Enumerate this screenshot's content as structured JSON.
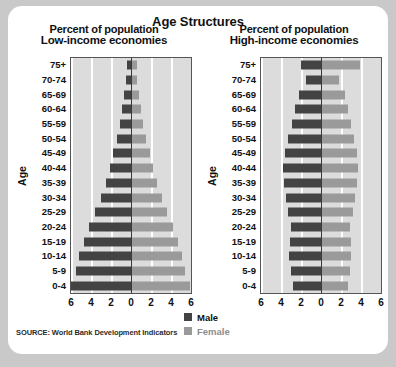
{
  "chart_data": {
    "type": "bar",
    "title": "Age Structures",
    "xlabel": "Percent of population",
    "ylabel": "Age",
    "grid": true,
    "legend_position": "bottom-center",
    "xlim": [
      -6,
      6
    ],
    "xticks": [
      "6",
      "4",
      "2",
      "0",
      "2",
      "4",
      "6"
    ],
    "xtick_values": [
      -6,
      -4,
      -2,
      0,
      2,
      4,
      6
    ],
    "categories": [
      "0-4",
      "5-9",
      "10-14",
      "15-19",
      "20-24",
      "25-29",
      "30-34",
      "35-39",
      "40-44",
      "45-49",
      "50-54",
      "55-59",
      "60-64",
      "65-69",
      "70-74",
      "75+"
    ],
    "legend": [
      {
        "name": "Male",
        "color": "#434343"
      },
      {
        "name": "Female",
        "color": "#9a9a9a"
      }
    ],
    "panels": [
      {
        "title": "Low-income economies",
        "series": [
          {
            "name": "Male",
            "side": "left",
            "values": [
              6.0,
              5.5,
              5.2,
              4.7,
              4.2,
              3.6,
              3.0,
              2.5,
              2.1,
              1.8,
              1.4,
              1.1,
              0.9,
              0.7,
              0.5,
              0.4
            ]
          },
          {
            "name": "Female",
            "side": "right",
            "values": [
              5.9,
              5.4,
              5.1,
              4.7,
              4.2,
              3.6,
              3.1,
              2.6,
              2.2,
              1.9,
              1.5,
              1.2,
              1.0,
              0.8,
              0.6,
              0.6
            ]
          }
        ]
      },
      {
        "title": "High-income economies",
        "series": [
          {
            "name": "Male",
            "side": "left",
            "values": [
              2.8,
              3.0,
              3.2,
              3.1,
              3.0,
              3.3,
              3.5,
              3.7,
              3.8,
              3.6,
              3.3,
              2.9,
              2.6,
              2.2,
              1.5,
              2.0
            ]
          },
          {
            "name": "Female",
            "side": "right",
            "values": [
              2.7,
              2.9,
              3.0,
              3.0,
              2.9,
              3.2,
              3.4,
              3.6,
              3.7,
              3.6,
              3.3,
              3.0,
              2.7,
              2.4,
              1.8,
              3.9
            ]
          }
        ]
      }
    ]
  },
  "source": "SOURCE: World Bank Development Indicators"
}
